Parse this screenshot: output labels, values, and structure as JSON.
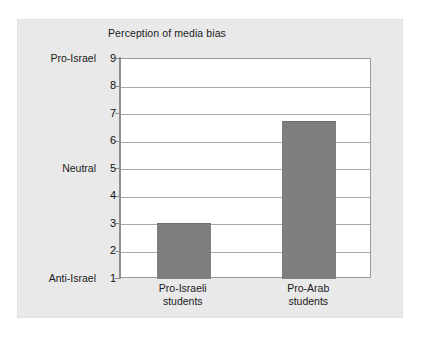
{
  "figure": {
    "title": "Perception of media bias",
    "panel_bg": "#e9e9e9",
    "plot_bg": "#ffffff",
    "bar_color": "#7e7e7e",
    "gridline_color": "#a9a9a9",
    "axis_color": "#8e8e8e"
  },
  "chart_data": {
    "type": "bar",
    "title": "Perception of media bias",
    "xlabel": "",
    "ylabel": "",
    "categories": [
      "Pro-Israeli students",
      "Pro-Arab students"
    ],
    "category_lines": [
      [
        "Pro-Israeli",
        "students"
      ],
      [
        "Pro-Arab",
        "students"
      ]
    ],
    "values": [
      3.05,
      6.74
    ],
    "ylim": [
      1,
      9
    ],
    "yticks": [
      1,
      2,
      3,
      4,
      5,
      6,
      7,
      8,
      9
    ],
    "ytick_labels": [
      "1",
      "2",
      "3",
      "4",
      "5",
      "6",
      "7",
      "8",
      "9"
    ],
    "y_scale_anchors": [
      {
        "value": 9,
        "label": "Pro-Israel"
      },
      {
        "value": 5,
        "label": "Neutral"
      },
      {
        "value": 1,
        "label": "Anti-Israel"
      }
    ],
    "grid": true,
    "grid_axis": "y",
    "legend": false,
    "legend_position": "none",
    "series": [
      {
        "name": "Perception of media bias",
        "values": [
          3.05,
          6.74
        ],
        "color": "#7e7e7e"
      }
    ],
    "annotations": []
  }
}
